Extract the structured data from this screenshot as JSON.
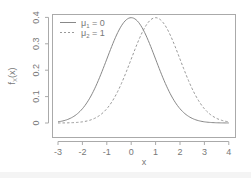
{
  "chart_data": {
    "type": "line",
    "title": "",
    "xlabel": "x",
    "ylabel": "f_X(x)",
    "xlim": [
      -3,
      4
    ],
    "ylim": [
      0,
      0.4
    ],
    "x_ticks": [
      -3,
      -2,
      -1,
      0,
      1,
      2,
      3,
      4
    ],
    "y_ticks": [
      0,
      0.1,
      0.2,
      0.3,
      0.4
    ],
    "x_tick_labels": [
      "-3",
      "-2",
      "-1",
      "0",
      "1",
      "2",
      "3",
      "4"
    ],
    "y_tick_labels": [
      "0",
      "0.1",
      "0.2",
      "0.3",
      "0.4"
    ],
    "grid": false,
    "legend_position": "top-left",
    "series": [
      {
        "name": "μ1 = 0",
        "style": "solid",
        "color": "#888888",
        "mean": 0,
        "sd": 1,
        "x": [
          -3,
          -2,
          -1,
          0,
          1,
          2,
          3,
          4
        ],
        "values": [
          0.004,
          0.054,
          0.242,
          0.399,
          0.242,
          0.054,
          0.004,
          0.0001
        ]
      },
      {
        "name": "μ2 = 1",
        "style": "dashed",
        "color": "#999999",
        "mean": 1,
        "sd": 1,
        "x": [
          -3,
          -2,
          -1,
          0,
          1,
          2,
          3,
          4
        ],
        "values": [
          0.0001,
          0.004,
          0.054,
          0.242,
          0.399,
          0.242,
          0.054,
          0.004
        ]
      }
    ]
  },
  "legend": {
    "items": [
      {
        "label_main": "μ",
        "label_sub": "1",
        "label_rest": " = 0"
      },
      {
        "label_main": "μ",
        "label_sub": "2",
        "label_rest": " = 1"
      }
    ]
  },
  "axes": {
    "xlabel": "x",
    "ylabel_main": "f",
    "ylabel_sub": "X",
    "ylabel_rest": "(x)"
  }
}
